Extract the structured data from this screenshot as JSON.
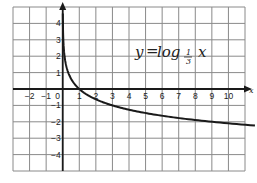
{
  "chart_data": {
    "type": "line",
    "title": "",
    "annotation": {
      "text": "y = log_{1/3} x",
      "lhs": "y",
      "equals": "=",
      "func": "log",
      "base_num": "1",
      "base_den": "3",
      "arg": "x"
    },
    "xlabel": "x",
    "ylabel": "",
    "xlim": [
      -3,
      11
    ],
    "ylim": [
      -5,
      5
    ],
    "grid": true,
    "x_ticks": [
      -2,
      -1,
      0,
      1,
      2,
      3,
      4,
      5,
      6,
      7,
      8,
      9,
      10
    ],
    "y_ticks": [
      4,
      3,
      2,
      1,
      -1,
      -2,
      -3,
      -4
    ],
    "series": [
      {
        "name": "y = log_{1/3} x",
        "x": [
          0.01,
          0.05,
          0.1,
          0.2,
          0.333,
          0.5,
          1,
          2,
          3,
          4,
          5,
          6,
          7,
          8,
          9,
          10,
          11.5
        ],
        "y": [
          4.19,
          2.73,
          2.1,
          1.46,
          1.0,
          0.63,
          0,
          -0.63,
          -1.0,
          -1.26,
          -1.46,
          -1.63,
          -1.77,
          -1.89,
          -2.0,
          -2.1,
          -2.22
        ]
      }
    ]
  },
  "labels": {
    "x_ticks": [
      "−2",
      "−1",
      "0",
      "1",
      "2",
      "3",
      "4",
      "5",
      "6",
      "7",
      "8",
      "9",
      "10"
    ],
    "y_ticks": [
      "4",
      "3",
      "2",
      "1",
      "−1",
      "−2",
      "−3",
      "−4"
    ],
    "x_axis": "x",
    "eq_lhs": "y",
    "eq_eq": "=",
    "eq_func": "log",
    "eq_base_num": "1",
    "eq_base_den": "3",
    "eq_arg": "x"
  }
}
